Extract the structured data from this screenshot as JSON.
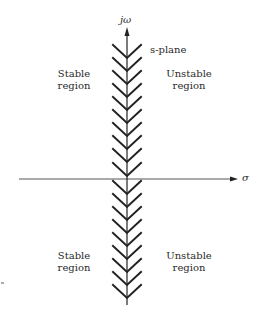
{
  "diagram": {
    "type": "s-plane stability regions",
    "plane_label": "s-plane",
    "axes": {
      "vertical_label": "jω",
      "horizontal_label": "σ"
    },
    "regions": {
      "upper_left": {
        "line1": "Stable",
        "line2": "region"
      },
      "upper_right": {
        "line1": "Unstable",
        "line2": "region"
      },
      "lower_left": {
        "line1": "Stable",
        "line2": "region"
      },
      "lower_right": {
        "line1": "Unstable",
        "line2": "region"
      }
    },
    "colors": {
      "lines": "#222222",
      "text": "#2a2a2a",
      "background": "#ffffff"
    }
  }
}
